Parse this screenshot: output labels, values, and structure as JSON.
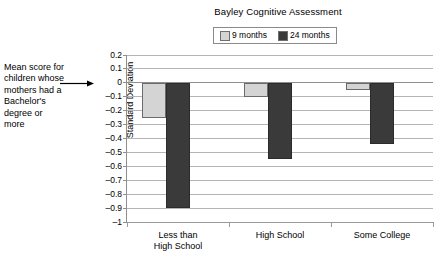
{
  "chart_data": {
    "type": "bar",
    "title": "Bayley Cognitive Assessment",
    "xlabel": "",
    "ylabel": "Standard Deviation",
    "categories": [
      "Less than High School",
      "High School",
      "Some College"
    ],
    "category_lines": [
      [
        "Less than",
        "High School"
      ],
      [
        "High School"
      ],
      [
        "Some College"
      ]
    ],
    "series": [
      {
        "name": "9 months",
        "color": "#d4d4d4",
        "values": [
          -0.25,
          -0.1,
          -0.05
        ]
      },
      {
        "name": "24 months",
        "color": "#3a3a3a",
        "values": [
          -0.9,
          -0.55,
          -0.44
        ]
      }
    ],
    "ylim": [
      -1,
      0.2
    ],
    "ytick_values": [
      0.2,
      0.1,
      0,
      -0.1,
      -0.2,
      -0.3,
      -0.4,
      -0.5,
      -0.6,
      -0.7,
      -0.8,
      -0.9,
      -1
    ],
    "ytick_labels": [
      "0.2",
      "0.1",
      "0",
      "–0.1",
      "–0.2",
      "–0.3",
      "–0.4",
      "–0.5",
      "–0.6",
      "–0.7",
      "–0.8",
      "–0.9",
      "–1"
    ],
    "grid": true,
    "legend_position": "top-center",
    "annotations": [
      {
        "text": "Mean score for children whose mothers had a Bachelor's degree or more",
        "lines": [
          "Mean score for",
          "children whose",
          "mothers had a",
          "Bachelor's",
          "degree or",
          "more"
        ],
        "points_to": 0
      }
    ]
  },
  "legend": {
    "entries": [
      {
        "label": "9 months",
        "color": "#d4d4d4"
      },
      {
        "label": "24 months",
        "color": "#3a3a3a"
      }
    ]
  }
}
